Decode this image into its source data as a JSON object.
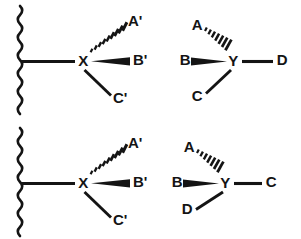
{
  "figure": {
    "ink_color": "#141414",
    "background_color": "#ffffff",
    "panels": [
      {
        "id": "top-left",
        "center_label": "X",
        "attachment": "wavy-bond",
        "substituents": [
          {
            "label": "A'",
            "bond_style": "hashed-wedge",
            "direction": "up-right"
          },
          {
            "label": "B'",
            "bond_style": "solid-wedge",
            "direction": "right"
          },
          {
            "label": "C'",
            "bond_style": "plain-line",
            "direction": "down-right"
          }
        ]
      },
      {
        "id": "top-right",
        "center_label": "Y",
        "attachment": "none",
        "substituents": [
          {
            "label": "A",
            "bond_style": "hashed-wedge",
            "direction": "up-left"
          },
          {
            "label": "B",
            "bond_style": "solid-wedge",
            "direction": "left"
          },
          {
            "label": "C",
            "bond_style": "plain-line",
            "direction": "down-left"
          },
          {
            "label": "D",
            "bond_style": "plain-line",
            "direction": "right"
          }
        ]
      },
      {
        "id": "bottom-left",
        "center_label": "X",
        "attachment": "wavy-bond",
        "substituents": [
          {
            "label": "A'",
            "bond_style": "hashed-wedge",
            "direction": "up-right"
          },
          {
            "label": "B'",
            "bond_style": "solid-wedge",
            "direction": "right"
          },
          {
            "label": "C'",
            "bond_style": "plain-line",
            "direction": "down-right"
          }
        ]
      },
      {
        "id": "bottom-right",
        "center_label": "Y",
        "attachment": "none",
        "substituents": [
          {
            "label": "A",
            "bond_style": "hashed-wedge",
            "direction": "up-left"
          },
          {
            "label": "B",
            "bond_style": "solid-wedge",
            "direction": "left"
          },
          {
            "label": "C",
            "bond_style": "plain-line",
            "direction": "right"
          },
          {
            "label": "D",
            "bond_style": "plain-line",
            "direction": "down-left"
          }
        ]
      }
    ],
    "labels": {
      "tl_center": "X",
      "tl_a": "A'",
      "tl_b": "B'",
      "tl_c": "C'",
      "tr_center": "Y",
      "tr_a": "A",
      "tr_b": "B",
      "tr_c": "C",
      "tr_d": "D",
      "bl_center": "X",
      "bl_a": "A'",
      "bl_b": "B'",
      "bl_c": "C'",
      "br_center": "Y",
      "br_a": "A",
      "br_b": "B",
      "br_c": "C",
      "br_d": "D"
    }
  }
}
